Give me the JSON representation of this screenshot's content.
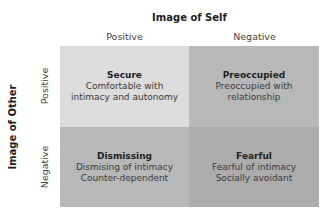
{
  "axes": {
    "x_title": "Image of Self",
    "y_title": "Image of Other",
    "x_labels": [
      "Positive",
      "Negative"
    ],
    "y_labels": [
      "Positive",
      "Negative"
    ]
  },
  "quadrants": {
    "secure": {
      "name": "Secure",
      "line1": "Comfortable with",
      "line2": "intimacy and autonomy"
    },
    "preoccupied": {
      "name": "Preoccupied",
      "line1": "Preoccupied with",
      "line2": "relationship"
    },
    "dismissing": {
      "name": "Dismissing",
      "line1": "Dismising of intimacy",
      "line2": "Counter-dependent"
    },
    "fearful": {
      "name": "Fearful",
      "line1": "Fearful of intimacy",
      "line2": "Socially avoidant"
    }
  },
  "colors": {
    "secure": "#dcdcdc",
    "preoccupied": "#b8b8b8",
    "dismissing": "#b8b8b8",
    "fearful": "#acacac"
  }
}
